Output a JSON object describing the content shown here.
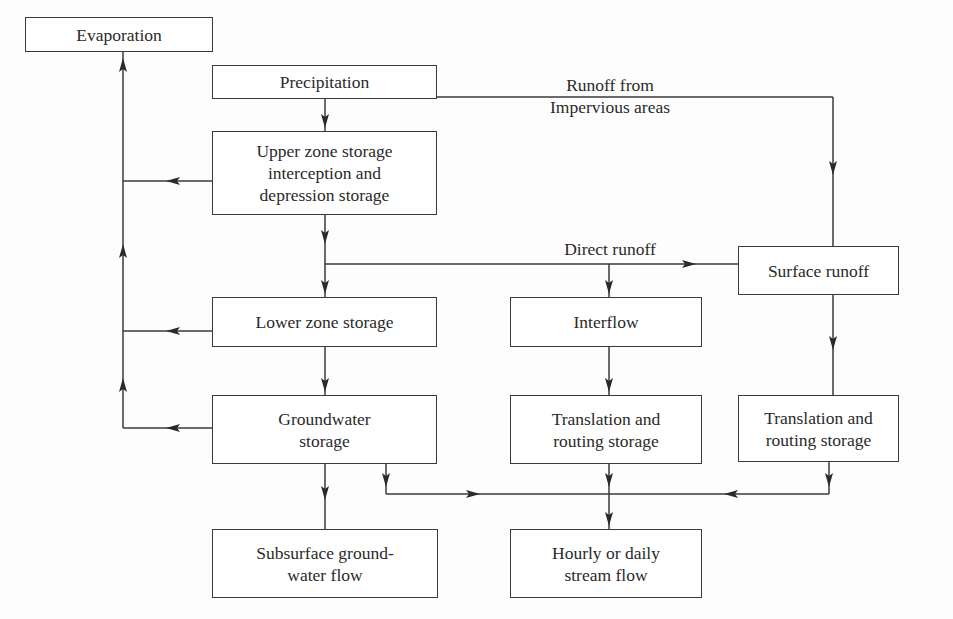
{
  "diagram": {
    "type": "flowchart",
    "colors": {
      "stroke": "#3a3a3a",
      "background": "#fdfdfd",
      "text": "#2a2a2a"
    },
    "nodes": {
      "evaporation": "Evaporation",
      "precipitation": "Precipitation",
      "upper_zone": "Upper zone storage\ninterception and\ndepression storage",
      "lower_zone": "Lower zone storage",
      "groundwater": "Groundwater\nstorage",
      "subsurface": "Subsurface ground-\nwater flow",
      "interflow": "Interflow",
      "translation_mid": "Translation and\nrouting storage",
      "surface_runoff": "Surface runoff",
      "translation_right": "Translation and\nrouting storage",
      "stream_flow": "Hourly or daily\nstream flow"
    },
    "edge_labels": {
      "impervious": "Runoff from\nImpervious areas",
      "direct_runoff": "Direct runoff"
    },
    "edges": [
      {
        "from": "precipitation",
        "to": "upper_zone"
      },
      {
        "from": "precipitation",
        "to": "surface_runoff",
        "label": "Runoff from Impervious areas"
      },
      {
        "from": "upper_zone",
        "to": "evaporation"
      },
      {
        "from": "upper_zone",
        "to": "lower_zone"
      },
      {
        "from": "upper_zone",
        "to": "interflow",
        "label": "Direct runoff"
      },
      {
        "from": "upper_zone",
        "to": "surface_runoff",
        "label": "Direct runoff"
      },
      {
        "from": "lower_zone",
        "to": "evaporation"
      },
      {
        "from": "lower_zone",
        "to": "groundwater"
      },
      {
        "from": "groundwater",
        "to": "evaporation"
      },
      {
        "from": "groundwater",
        "to": "subsurface"
      },
      {
        "from": "groundwater",
        "to": "stream_flow"
      },
      {
        "from": "interflow",
        "to": "translation_mid"
      },
      {
        "from": "translation_mid",
        "to": "stream_flow"
      },
      {
        "from": "surface_runoff",
        "to": "translation_right"
      },
      {
        "from": "translation_right",
        "to": "stream_flow"
      }
    ]
  }
}
